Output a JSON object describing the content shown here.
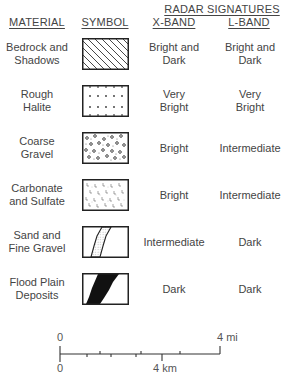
{
  "header": {
    "group_title": "RADAR SIGNATURES",
    "columns": [
      "MATERIAL",
      "SYMBOL",
      "X-BAND",
      "L-BAND"
    ]
  },
  "rows": [
    {
      "material": [
        "Bedrock and",
        "Shadows"
      ],
      "symbol": "diagonal-hatch",
      "x_band": [
        "Bright and",
        "Dark"
      ],
      "l_band": [
        "Bright and",
        "Dark"
      ]
    },
    {
      "material": [
        "Rough",
        "Halite"
      ],
      "symbol": "dots-grid",
      "x_band": [
        "Very",
        "Bright"
      ],
      "l_band": [
        "Very",
        "Bright"
      ]
    },
    {
      "material": [
        "Coarse",
        "Gravel"
      ],
      "symbol": "small-circles",
      "x_band": [
        "Bright"
      ],
      "l_band": [
        "Intermediate"
      ]
    },
    {
      "material": [
        "Carbonate",
        "and Sulfate"
      ],
      "symbol": "L-marks-stipple",
      "x_band": [
        "Bright"
      ],
      "l_band": [
        "Intermediate"
      ]
    },
    {
      "material": [
        "Sand and",
        "Fine Gravel"
      ],
      "symbol": "stippled-band",
      "x_band": [
        "Intermediate"
      ],
      "l_band": [
        "Dark"
      ]
    },
    {
      "material": [
        "Flood Plain",
        "Deposits"
      ],
      "symbol": "solid-black-band",
      "x_band": [
        "Dark"
      ],
      "l_band": [
        "Dark"
      ]
    }
  ],
  "scale_bar": {
    "top_left": "0",
    "top_right": "4 mi",
    "bottom_left": "0",
    "bottom_mid": "4 km"
  }
}
